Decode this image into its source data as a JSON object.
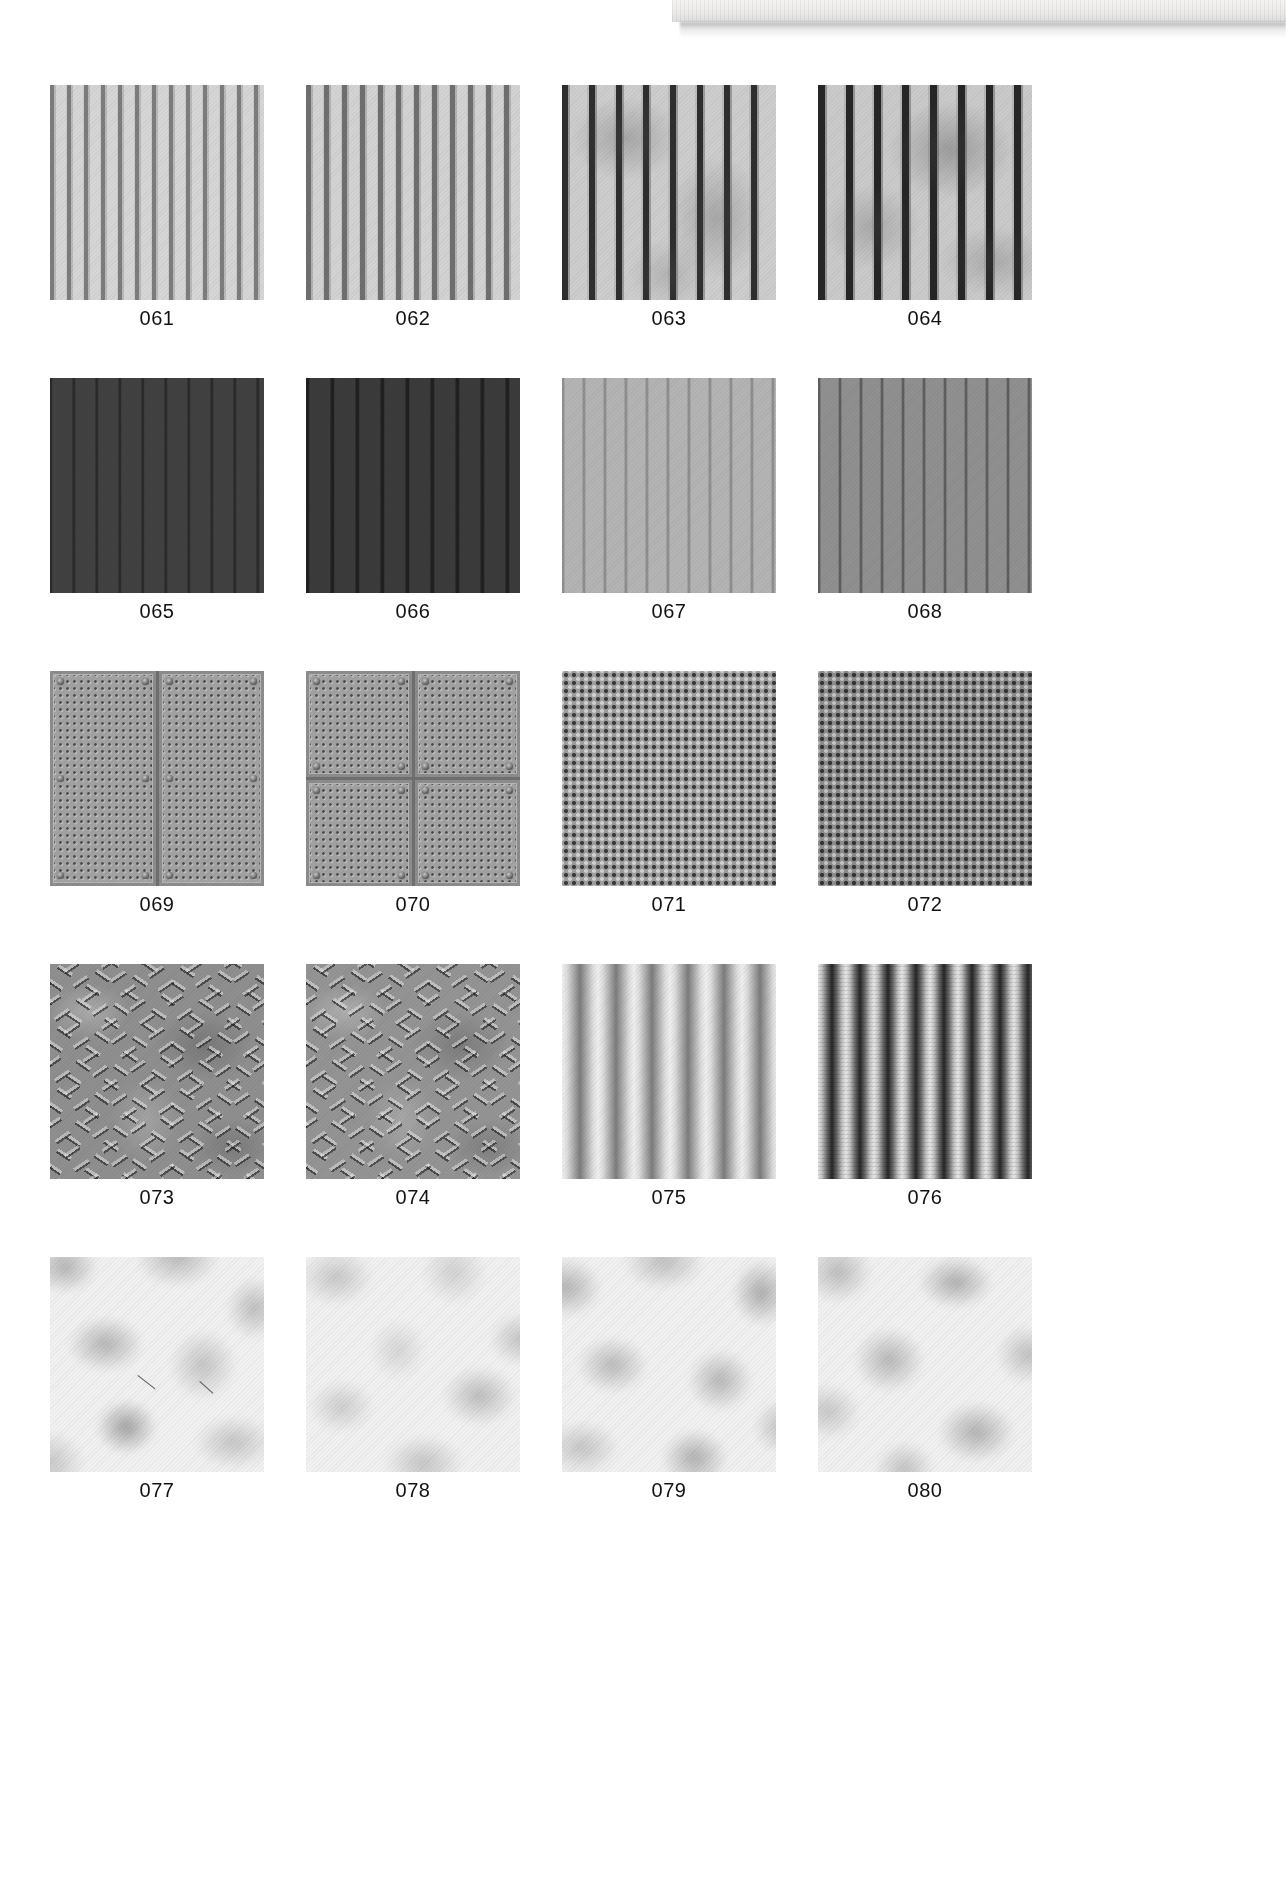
{
  "page": {
    "kind": "texture-reference-sheet",
    "background_color": "#ffffff",
    "scan_artifact": {
      "present": true,
      "description": "pale paper edge strip with drop shadow at top-right of scan"
    }
  },
  "grid": {
    "columns": 4,
    "rows": 5,
    "label_position": "below-swatch"
  },
  "swatches": [
    {
      "id": "061",
      "label": "061",
      "row": 1,
      "col": 1,
      "style": "tex-stripe-a",
      "name": "vertical-siding-light",
      "base_color": "#cfcfcf"
    },
    {
      "id": "062",
      "label": "062",
      "row": 1,
      "col": 2,
      "style": "tex-stripe-b",
      "name": "vertical-siding-light-wide",
      "base_color": "#cbcbcb"
    },
    {
      "id": "063",
      "label": "063",
      "row": 1,
      "col": 3,
      "style": "tex-stripe-c",
      "name": "vertical-siding-weathered",
      "base_color": "#c6c6c6"
    },
    {
      "id": "064",
      "label": "064",
      "row": 1,
      "col": 4,
      "style": "tex-stripe-d",
      "name": "vertical-siding-weathered-2",
      "base_color": "#c2c2c2"
    },
    {
      "id": "065",
      "label": "065",
      "row": 2,
      "col": 1,
      "style": "tex-dark-a",
      "name": "dark-panel-siding",
      "base_color": "#3a3a3a"
    },
    {
      "id": "066",
      "label": "066",
      "row": 2,
      "col": 2,
      "style": "tex-dark-b",
      "name": "dark-panel-siding-2",
      "base_color": "#333333"
    },
    {
      "id": "067",
      "label": "067",
      "row": 2,
      "col": 3,
      "style": "tex-mid-a",
      "name": "light-grey-panel-siding",
      "base_color": "#adadad"
    },
    {
      "id": "068",
      "label": "068",
      "row": 2,
      "col": 4,
      "style": "tex-mid-b",
      "name": "mid-grey-panel-siding",
      "base_color": "#8a8a8a"
    },
    {
      "id": "069",
      "label": "069",
      "row": 3,
      "col": 1,
      "style": "plate-two",
      "name": "perforated-plate-two-panel",
      "base_color": "#a2a2a2"
    },
    {
      "id": "070",
      "label": "070",
      "row": 3,
      "col": 2,
      "style": "plate-four",
      "name": "perforated-plate-four-panel",
      "base_color": "#a2a2a2"
    },
    {
      "id": "071",
      "label": "071",
      "row": 3,
      "col": 3,
      "style": "tex-mesh-a",
      "name": "perforated-mesh-light",
      "base_color": "#9e9e9e"
    },
    {
      "id": "072",
      "label": "072",
      "row": 3,
      "col": 4,
      "style": "tex-mesh-b",
      "name": "perforated-mesh-dark",
      "base_color": "#8c8c8c"
    },
    {
      "id": "073",
      "label": "073",
      "row": 4,
      "col": 1,
      "style": "diamond-1",
      "name": "diamond-tread-plate",
      "base_color": "#8f8f8f"
    },
    {
      "id": "074",
      "label": "074",
      "row": 4,
      "col": 2,
      "style": "diamond-2",
      "name": "diamond-tread-plate-2",
      "base_color": "#949494"
    },
    {
      "id": "075",
      "label": "075",
      "row": 4,
      "col": 3,
      "style": "tex-corrug-a",
      "name": "corrugated-metal-light",
      "base_color": "#b5b5b5"
    },
    {
      "id": "076",
      "label": "076",
      "row": 4,
      "col": 4,
      "style": "tex-corrug-b",
      "name": "corrugated-metal-dark",
      "base_color": "#7e7e7e"
    },
    {
      "id": "077",
      "label": "077",
      "row": 5,
      "col": 1,
      "style": "cloud-1",
      "name": "cloud-noise-grey",
      "base_color": "#f1f1f1"
    },
    {
      "id": "078",
      "label": "078",
      "row": 5,
      "col": 2,
      "style": "cloud-2",
      "name": "cloud-noise-light",
      "base_color": "#f4f4f4"
    },
    {
      "id": "079",
      "label": "079",
      "row": 5,
      "col": 3,
      "style": "cloud-3",
      "name": "cloud-noise-contrast",
      "base_color": "#f1f1f1"
    },
    {
      "id": "080",
      "label": "080",
      "row": 5,
      "col": 4,
      "style": "cloud-4",
      "name": "cloud-noise-soft",
      "base_color": "#f2f2f2"
    }
  ]
}
